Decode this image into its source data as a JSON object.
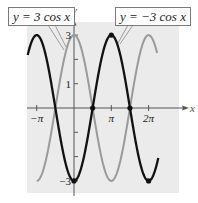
{
  "chart_data": {
    "type": "line",
    "title": "",
    "xlabel": "x",
    "ylabel": "y",
    "xlim": [
      -4.3,
      7.1
    ],
    "ylim": [
      -3.5,
      3.5
    ],
    "x_ticks": [
      {
        "value": -3.14159,
        "label": "−π"
      },
      {
        "value": 3.14159,
        "label": "π"
      },
      {
        "value": 6.28319,
        "label": "2π"
      }
    ],
    "y_ticks": [
      {
        "value": 3,
        "label": "3"
      },
      {
        "value": 2,
        "label": ""
      },
      {
        "value": 1,
        "label": "1"
      },
      {
        "value": -1,
        "label": ""
      },
      {
        "value": -2,
        "label": ""
      },
      {
        "value": -3,
        "label": "−3"
      }
    ],
    "grid": false,
    "series": [
      {
        "name": "y = 3 cos x",
        "function": "3*cos(x)",
        "color": "#9a9a9a",
        "domain": [
          -3.14159,
          7.0
        ]
      },
      {
        "name": "y = −3 cos x",
        "function": "-3*cos(x)",
        "color": "#111111",
        "domain": [
          -3.9,
          7.1
        ]
      }
    ],
    "marked_points": [
      {
        "x": 0,
        "y": -3
      },
      {
        "x": 1.5708,
        "y": 0
      },
      {
        "x": 3.14159,
        "y": 3
      },
      {
        "x": 4.71239,
        "y": 0
      },
      {
        "x": 6.28319,
        "y": -3
      }
    ],
    "annotations": [
      {
        "text": "y = 3 cos x",
        "points_to": "gray curve"
      },
      {
        "text": "y = −3 cos x",
        "points_to": "black curve"
      }
    ],
    "background_color": "#ebebeb"
  },
  "labels": {
    "left_callout": "y = 3 cos x",
    "right_callout": "y = −3 cos x",
    "x_axis": "x",
    "y_axis": "y"
  }
}
